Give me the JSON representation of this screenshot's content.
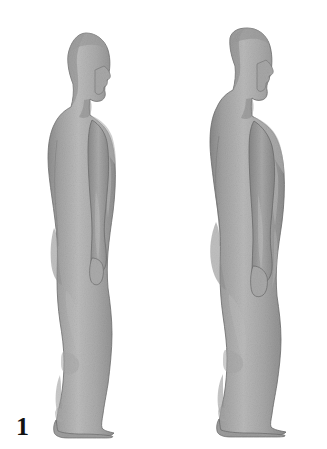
{
  "figure": {
    "background_color": "#ffffff",
    "body_fill_light": "#b9b9b9",
    "body_fill_mid": "#9d9d9d",
    "body_fill_dark": "#838383",
    "outline_color": "#6e6e6e",
    "label_color": "#121212",
    "figures": [
      {
        "label": "1",
        "view": "left-lateral-profile",
        "facing": "right",
        "build": "lean",
        "label_x": 16,
        "label_y": 414
      },
      {
        "label": "5",
        "view": "left-lateral-profile",
        "facing": "right",
        "build": "heavier",
        "label_x": 209,
        "label_y": 414
      }
    ]
  }
}
